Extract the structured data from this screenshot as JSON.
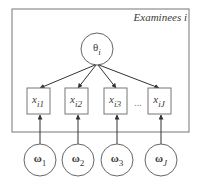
{
  "diagram": {
    "type": "plate-notation",
    "plate": {
      "label": "Examinees i"
    },
    "latent": {
      "id": "theta",
      "label": "θ",
      "subscript": "i"
    },
    "items": [
      {
        "id": "x1",
        "label": "x",
        "subscript": "i1"
      },
      {
        "id": "x2",
        "label": "x",
        "subscript": "i2"
      },
      {
        "id": "x3",
        "label": "x",
        "subscript": "i3"
      },
      {
        "id": "xJ",
        "label": "x",
        "subscript": "iJ"
      }
    ],
    "ellipsis": "...",
    "parameters": [
      {
        "id": "w1",
        "label": "ω",
        "subscript": "1"
      },
      {
        "id": "w2",
        "label": "ω",
        "subscript": "2"
      },
      {
        "id": "w3",
        "label": "ω",
        "subscript": "3"
      },
      {
        "id": "wJ",
        "label": "ω",
        "subscript": "J"
      }
    ],
    "edges": [
      [
        "theta",
        "x1"
      ],
      [
        "theta",
        "x2"
      ],
      [
        "theta",
        "x3"
      ],
      [
        "theta",
        "xJ"
      ],
      [
        "w1",
        "x1"
      ],
      [
        "w2",
        "x2"
      ],
      [
        "w3",
        "x3"
      ],
      [
        "wJ",
        "xJ"
      ]
    ],
    "colors": {
      "stroke": "#555555",
      "text": "#3a3a3a",
      "background": "#ffffff"
    }
  }
}
